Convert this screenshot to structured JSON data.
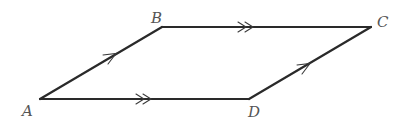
{
  "diagram": {
    "type": "parallelogram",
    "vertices": [
      {
        "label": "A",
        "x": 40,
        "y": 99,
        "label_x": 22,
        "label_y": 116
      },
      {
        "label": "B",
        "x": 162,
        "y": 27,
        "label_x": 150,
        "label_y": 23
      },
      {
        "label": "C",
        "x": 371,
        "y": 27,
        "label_x": 377,
        "label_y": 27
      },
      {
        "label": "D",
        "x": 249,
        "y": 99,
        "label_x": 248,
        "label_y": 117
      }
    ],
    "edges": [
      {
        "from": "A",
        "to": "B",
        "arrow": "single"
      },
      {
        "from": "B",
        "to": "C",
        "arrow": "double"
      },
      {
        "from": "D",
        "to": "C",
        "arrow": "single"
      },
      {
        "from": "A",
        "to": "D",
        "arrow": "double"
      }
    ],
    "labels": {
      "A": "A",
      "B": "B",
      "C": "C",
      "D": "D"
    },
    "colors": {
      "line": "#2a2a2a",
      "label": "#555555",
      "background": "#ffffff"
    }
  }
}
